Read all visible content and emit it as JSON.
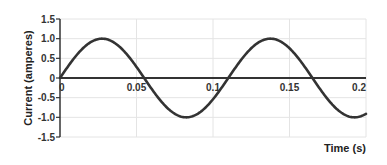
{
  "chart_data": {
    "type": "line",
    "title": "",
    "xlabel": "Time (s)",
    "ylabel": "Current (amperes)",
    "xlim": [
      0,
      0.2
    ],
    "ylim": [
      -1.5,
      1.5
    ],
    "x_ticks": [
      "0",
      "0.05",
      "0.1",
      "0.15",
      "0.2"
    ],
    "x_tick_values": [
      0,
      0.05,
      0.1,
      0.15,
      0.2
    ],
    "y_ticks": [
      "1.5",
      "1.0",
      "0.5",
      "0",
      "-0.5",
      "-1.0",
      "-1.5"
    ],
    "y_tick_values": [
      1.5,
      1.0,
      0.5,
      0,
      -0.5,
      -1.0,
      -1.5
    ],
    "grid": true,
    "legend": null,
    "series": [
      {
        "name": "Current",
        "function": "sine",
        "amplitude": 1.0,
        "period_s": 0.11,
        "color": "#333333",
        "x": [
          0,
          0.0275,
          0.055,
          0.0825,
          0.11,
          0.1375,
          0.165,
          0.1925,
          0.2
        ],
        "values": [
          0,
          1.0,
          0,
          -1.0,
          0,
          1.0,
          0,
          -1.0,
          -0.9
        ]
      }
    ]
  },
  "colors": {
    "axis": "#333333",
    "grid": "#e4e4e4",
    "line": "#333333"
  }
}
